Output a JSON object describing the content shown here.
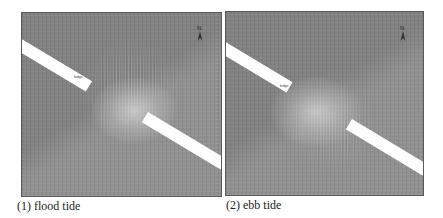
{
  "figure": {
    "panels": [
      {
        "id": "flood",
        "caption": "(1) flood tide",
        "north_label": "N",
        "bridge_label": "bridge"
      },
      {
        "id": "ebb",
        "caption": "(2) ebb tide",
        "north_label": "N",
        "bridge_label": "bridge"
      }
    ],
    "colors": {
      "water": "#8a8a8a",
      "bridge": "#ffffff",
      "border": "#5a5a5a"
    }
  }
}
